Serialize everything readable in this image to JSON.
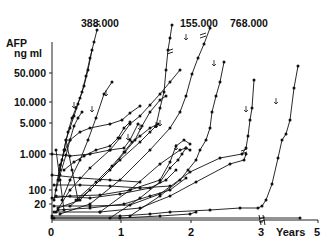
{
  "chart_data": {
    "type": "line",
    "title": "",
    "ylabel": "AFP ng ml",
    "ylabel_lines": [
      "AFP",
      "ng ml"
    ],
    "xlabel": "Years",
    "yscale": "log",
    "grid": false,
    "legend": null,
    "y_ticks": [
      {
        "label": "50.000",
        "value": 50000,
        "py": 73
      },
      {
        "label": "10.000",
        "value": 10000,
        "py": 102
      },
      {
        "label": "5.000",
        "value": 5000,
        "py": 123
      },
      {
        "label": "1.000",
        "value": 1000,
        "py": 154
      },
      {
        "label": "100",
        "value": 100,
        "py": 190
      },
      {
        "label": "20",
        "value": 20,
        "py": 204
      }
    ],
    "x_ticks": [
      {
        "label": "0",
        "value": 0,
        "px": 52
      },
      {
        "label": "1",
        "value": 1,
        "px": 121
      },
      {
        "label": "2",
        "value": 2,
        "px": 191
      },
      {
        "label": "3",
        "value": 3,
        "px": 262
      },
      {
        "label": "5",
        "value": 5,
        "px": 318
      }
    ],
    "x_axis_break_at": 3,
    "peak_annotations": [
      {
        "label": "388.000",
        "value": 388000,
        "x_year": 0.8
      },
      {
        "label": "155.000",
        "value": 155000,
        "x_year": 1.5
      },
      {
        "label": "768.000",
        "value": 768000,
        "x_year": 2.2
      }
    ],
    "annotation_note": "Arrows (↓) mark points on individual patient trajectories; '//' marks truncated axis segments toward off-scale peaks.",
    "series_pixels": [
      [
        [
          58,
          180
        ],
        [
          62,
          160
        ],
        [
          66,
          140
        ],
        [
          70,
          128
        ],
        [
          74,
          116
        ],
        [
          78,
          104
        ],
        [
          82,
          92
        ],
        [
          86,
          76
        ],
        [
          90,
          58
        ],
        [
          94,
          42
        ],
        [
          97,
          30
        ]
      ],
      [
        [
          60,
          170
        ],
        [
          64,
          150
        ],
        [
          68,
          132
        ],
        [
          72,
          118
        ],
        [
          76,
          108
        ],
        [
          80,
          98
        ],
        [
          84,
          86
        ],
        [
          88,
          70
        ],
        [
          92,
          50
        ]
      ],
      [
        [
          56,
          190
        ],
        [
          60,
          175
        ],
        [
          66,
          155
        ],
        [
          70,
          140
        ],
        [
          74,
          126
        ],
        [
          78,
          118
        ],
        [
          82,
          112
        ]
      ],
      [
        [
          62,
          200
        ],
        [
          70,
          180
        ],
        [
          80,
          160
        ],
        [
          88,
          140
        ],
        [
          96,
          118
        ],
        [
          104,
          94
        ],
        [
          112,
          82
        ]
      ],
      [
        [
          54,
          200
        ],
        [
          60,
          165
        ],
        [
          65,
          150
        ],
        [
          70,
          140
        ],
        [
          80,
          132
        ],
        [
          90,
          128
        ],
        [
          110,
          124
        ],
        [
          122,
          120
        ],
        [
          130,
          113
        ],
        [
          140,
          106
        ]
      ],
      [
        [
          56,
          212
        ],
        [
          70,
          190
        ],
        [
          90,
          168
        ],
        [
          110,
          150
        ],
        [
          120,
          138
        ],
        [
          130,
          124
        ],
        [
          140,
          116
        ],
        [
          150,
          105
        ],
        [
          160,
          94
        ],
        [
          170,
          82
        ],
        [
          180,
          70
        ]
      ],
      [
        [
          58,
          208
        ],
        [
          80,
          200
        ],
        [
          100,
          180
        ],
        [
          120,
          160
        ],
        [
          140,
          142
        ],
        [
          150,
          132
        ],
        [
          156,
          126
        ],
        [
          160,
          108
        ],
        [
          164,
          92
        ],
        [
          166,
          70
        ],
        [
          168,
          50
        ],
        [
          170,
          38
        ],
        [
          172,
          25
        ]
      ],
      [
        [
          60,
          214
        ],
        [
          90,
          204
        ],
        [
          120,
          180
        ],
        [
          150,
          150
        ],
        [
          170,
          128
        ],
        [
          180,
          112
        ],
        [
          186,
          96
        ],
        [
          192,
          74
        ],
        [
          198,
          58
        ],
        [
          204,
          44
        ],
        [
          210,
          28
        ]
      ],
      [
        [
          52,
          198
        ],
        [
          70,
          196
        ],
        [
          100,
          195
        ],
        [
          130,
          190
        ],
        [
          160,
          180
        ],
        [
          170,
          162
        ],
        [
          176,
          146
        ],
        [
          184,
          140
        ],
        [
          190,
          144
        ]
      ],
      [
        [
          54,
          206
        ],
        [
          90,
          206
        ],
        [
          130,
          205
        ],
        [
          160,
          194
        ],
        [
          190,
          172
        ],
        [
          220,
          158
        ],
        [
          242,
          154
        ],
        [
          246,
          148
        ],
        [
          248,
          136
        ],
        [
          250,
          120
        ],
        [
          252,
          108
        ],
        [
          254,
          80
        ]
      ],
      [
        [
          54,
          212
        ],
        [
          100,
          212
        ],
        [
          140,
          208
        ],
        [
          170,
          196
        ],
        [
          196,
          182
        ],
        [
          230,
          164
        ],
        [
          244,
          160
        ],
        [
          246,
          154
        ]
      ],
      [
        [
          52,
          216
        ],
        [
          120,
          216
        ],
        [
          150,
          214
        ],
        [
          170,
          212
        ],
        [
          210,
          210
        ],
        [
          240,
          208
        ],
        [
          258,
          208
        ],
        [
          262,
          206
        ],
        [
          266,
          200
        ],
        [
          272,
          184
        ],
        [
          278,
          158
        ],
        [
          282,
          140
        ],
        [
          286,
          134
        ],
        [
          290,
          120
        ],
        [
          294,
          88
        ],
        [
          298,
          66
        ]
      ],
      [
        [
          52,
          154
        ],
        [
          70,
          156
        ],
        [
          90,
          154
        ],
        [
          110,
          150
        ],
        [
          124,
          148
        ],
        [
          130,
          140
        ],
        [
          138,
          124
        ]
      ],
      [
        [
          52,
          175
        ],
        [
          80,
          178
        ],
        [
          110,
          180
        ],
        [
          140,
          182
        ]
      ],
      [
        [
          54,
          185
        ],
        [
          80,
          185
        ],
        [
          110,
          186
        ],
        [
          140,
          188
        ],
        [
          170,
          186
        ]
      ],
      [
        [
          56,
          196
        ],
        [
          90,
          198
        ],
        [
          120,
          194
        ],
        [
          150,
          188
        ],
        [
          166,
          180
        ],
        [
          176,
          170
        ]
      ],
      [
        [
          58,
          210
        ],
        [
          90,
          208
        ],
        [
          124,
          204
        ],
        [
          150,
          196
        ],
        [
          170,
          190
        ],
        [
          186,
          178
        ]
      ],
      [
        [
          54,
          218
        ],
        [
          120,
          218
        ],
        [
          160,
          216
        ],
        [
          190,
          214
        ],
        [
          196,
          212
        ]
      ],
      [
        [
          52,
          218
        ],
        [
          300,
          218
        ]
      ],
      [
        [
          64,
          170
        ],
        [
          74,
          162
        ],
        [
          84,
          156
        ],
        [
          96,
          150
        ],
        [
          110,
          146
        ],
        [
          118,
          138
        ],
        [
          124,
          128
        ],
        [
          130,
          122
        ]
      ],
      [
        [
          70,
          206
        ],
        [
          90,
          190
        ],
        [
          110,
          170
        ],
        [
          125,
          152
        ],
        [
          135,
          140
        ],
        [
          142,
          126
        ],
        [
          150,
          112
        ],
        [
          160,
          100
        ],
        [
          166,
          96
        ]
      ],
      [
        [
          76,
          200
        ],
        [
          96,
          182
        ],
        [
          112,
          166
        ],
        [
          124,
          152
        ],
        [
          132,
          142
        ],
        [
          140,
          136
        ],
        [
          150,
          128
        ],
        [
          158,
          124
        ]
      ],
      [
        [
          56,
          150
        ],
        [
          60,
          180
        ],
        [
          64,
          210
        ]
      ],
      [
        [
          66,
          140
        ],
        [
          72,
          170
        ],
        [
          78,
          200
        ]
      ],
      [
        [
          100,
          212
        ],
        [
          130,
          190
        ],
        [
          160,
          164
        ],
        [
          180,
          150
        ],
        [
          186,
          148
        ],
        [
          190,
          150
        ]
      ],
      [
        [
          110,
          218
        ],
        [
          140,
          198
        ],
        [
          160,
          182
        ],
        [
          170,
          168
        ],
        [
          178,
          160
        ],
        [
          182,
          154
        ],
        [
          186,
          148
        ]
      ],
      [
        [
          130,
          216
        ],
        [
          160,
          196
        ],
        [
          180,
          180
        ],
        [
          188,
          170
        ],
        [
          196,
          160
        ],
        [
          200,
          150
        ],
        [
          206,
          140
        ],
        [
          210,
          128
        ],
        [
          212,
          112
        ],
        [
          216,
          96
        ],
        [
          220,
          82
        ],
        [
          224,
          62
        ]
      ]
    ],
    "arrow_markers_pixels": [
      [
        74,
        108
      ],
      [
        92,
        112
      ],
      [
        106,
        96
      ],
      [
        128,
        140
      ],
      [
        140,
        130
      ],
      [
        156,
        128
      ],
      [
        186,
        40
      ],
      [
        214,
        66
      ],
      [
        246,
        112
      ],
      [
        276,
        104
      ],
      [
        160,
        126
      ],
      [
        176,
        150
      ]
    ],
    "break_marks_pixels": [
      [
        97,
        24
      ],
      [
        170,
        52
      ],
      [
        203,
        36
      ],
      [
        262,
        220
      ],
      [
        244,
        152
      ]
    ]
  }
}
